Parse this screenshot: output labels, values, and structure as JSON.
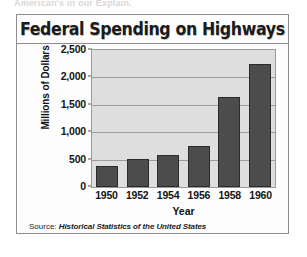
{
  "page": {
    "top_fragment": "American's in our Explain."
  },
  "figure": {
    "source_label": "Source:",
    "source_text": "Historical Statistics of the United States"
  },
  "chart_data": {
    "type": "bar",
    "title": "Federal Spending on Highways",
    "xlabel": "Year",
    "ylabel": "Millions of Dollars",
    "categories": [
      "1950",
      "1952",
      "1954",
      "1956",
      "1958",
      "1960"
    ],
    "values": [
      385,
      520,
      585,
      750,
      1650,
      2250
    ],
    "ylim": [
      0,
      2500
    ],
    "ytick_labels": [
      "0",
      "500",
      "1,000",
      "1,500",
      "2,000",
      "2,500"
    ],
    "ytick_values": [
      0,
      500,
      1000,
      1500,
      2000,
      2500
    ],
    "grid": true,
    "legend": null,
    "bar_color": "#4c4c4c",
    "plot_background": "#dedede"
  }
}
